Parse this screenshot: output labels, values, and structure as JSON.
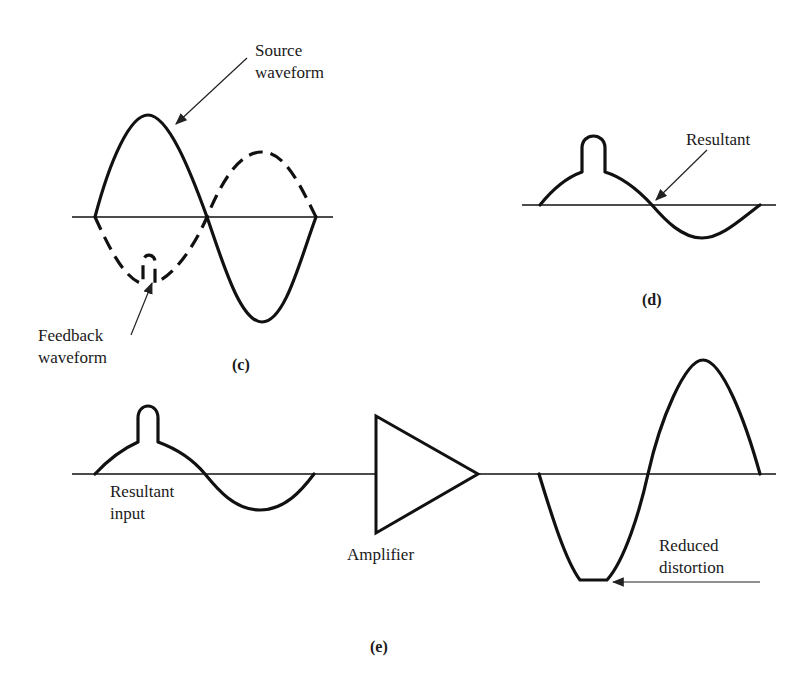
{
  "figure": {
    "panel_c": {
      "caption": "(c)",
      "labels": {
        "source": [
          "Source",
          "waveform"
        ],
        "feedback": [
          "Feedback",
          "waveform"
        ]
      }
    },
    "panel_d": {
      "caption": "(d)",
      "labels": {
        "resultant": "Resultant"
      }
    },
    "panel_e": {
      "caption": "(e)",
      "labels": {
        "resultant_input": [
          "Resultant",
          "input"
        ],
        "amplifier": "Amplifier",
        "reduced_distortion": [
          "Reduced",
          "distortion"
        ]
      }
    },
    "colors": {
      "ink": "#111111",
      "background": "#ffffff"
    }
  }
}
